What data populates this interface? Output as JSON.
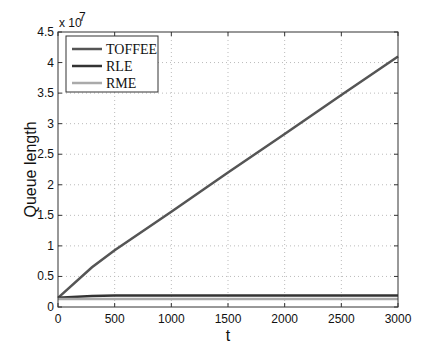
{
  "chart_data": {
    "type": "line",
    "title": "",
    "xlabel": "t",
    "ylabel": "Queue length",
    "y_multiplier_label": "x 10",
    "y_multiplier_exp": "7",
    "xlim": [
      0,
      3000
    ],
    "ylim": [
      0,
      4.5
    ],
    "y_scale": 10000000,
    "xticks": [
      0,
      500,
      1000,
      1500,
      2000,
      2500,
      3000
    ],
    "yticks": [
      0,
      0.5,
      1,
      1.5,
      2,
      2.5,
      3,
      3.5,
      4,
      4.5
    ],
    "ytick_labels": [
      "0",
      "0.5",
      "1",
      "1.5",
      "2",
      "2.5",
      "3",
      "3.5",
      "4",
      "4.5"
    ],
    "grid": true,
    "legend_position": "upper left",
    "series": [
      {
        "name": "TOFFEE",
        "color": "#555555",
        "x": [
          0,
          300,
          500,
          1000,
          1500,
          2000,
          2500,
          3000
        ],
        "values": [
          0.15,
          0.65,
          0.93,
          1.56,
          2.2,
          2.83,
          3.47,
          4.1
        ]
      },
      {
        "name": "RLE",
        "color": "#333333",
        "x": [
          0,
          300,
          500,
          1000,
          1500,
          2000,
          2500,
          3000
        ],
        "values": [
          0.15,
          0.18,
          0.19,
          0.19,
          0.19,
          0.19,
          0.19,
          0.19
        ]
      },
      {
        "name": "RME",
        "color": "#aaaaaa",
        "x": [
          0,
          300,
          500,
          1000,
          1500,
          2000,
          2500,
          3000
        ],
        "values": [
          0.13,
          0.13,
          0.13,
          0.13,
          0.13,
          0.13,
          0.13,
          0.13
        ]
      }
    ]
  }
}
